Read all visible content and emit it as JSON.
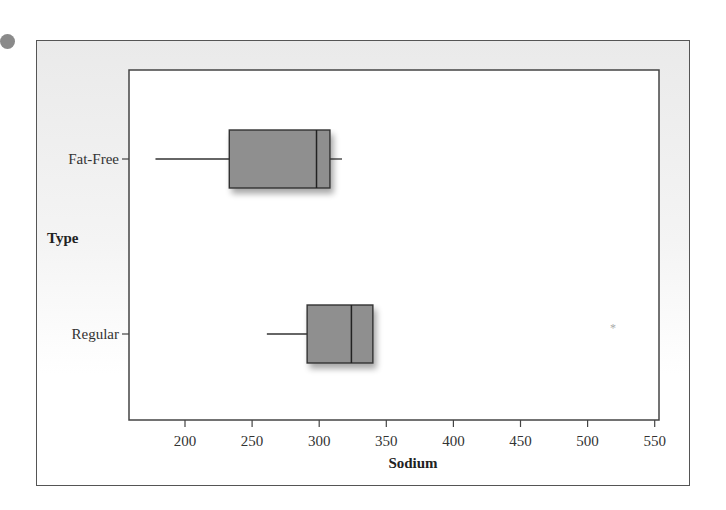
{
  "chart_data": {
    "type": "boxplot",
    "orientation": "horizontal",
    "title": "",
    "xlabel": "Sodium",
    "ylabel": "Type",
    "xlim": [
      160,
      555
    ],
    "xticks": [
      200,
      250,
      300,
      350,
      400,
      450,
      500,
      550
    ],
    "xtick_labels": [
      "200",
      "250",
      "300",
      "350",
      "400",
      "450",
      "500",
      "550"
    ],
    "grid": false,
    "legend": null,
    "categories": [
      "Fat-Free",
      "Regular"
    ],
    "series": [
      {
        "name": "Fat-Free",
        "whisker_low": 178,
        "q1": 233,
        "median": 298,
        "q3": 308,
        "whisker_high": 317,
        "outliers": []
      },
      {
        "name": "Regular",
        "whisker_low": 261,
        "q1": 291,
        "median": 324,
        "q3": 340,
        "whisker_high": 340,
        "outliers": [
          519
        ]
      }
    ],
    "colors": {
      "box_fill": "#8f8f8f",
      "line": "#333333"
    }
  },
  "labels": {
    "x_axis_title": "Sodium",
    "y_axis_title": "Type",
    "category_fat_free": "Fat-Free",
    "category_regular": "Regular"
  }
}
